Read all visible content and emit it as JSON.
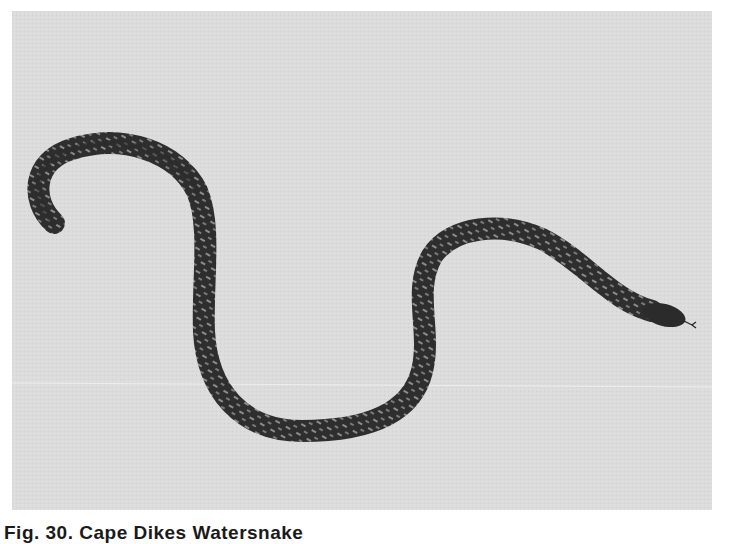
{
  "figure": {
    "background_color": "#dcdcdc",
    "snake_color": "#2b2b2b",
    "pattern_color": "#9a9a9a"
  },
  "caption": {
    "text": "Fig. 30. Cape Dikes Watersnake"
  }
}
